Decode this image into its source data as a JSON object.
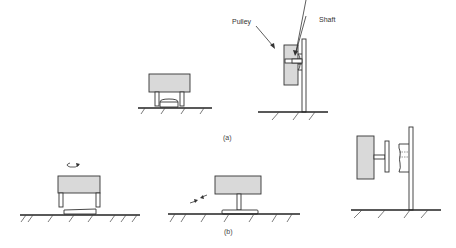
{
  "figure": {
    "panel_a": {
      "caption": "(a)",
      "labels": {
        "pulley": "Pulley",
        "shaft": "Shaft"
      },
      "left_view": "block on legs resting on pulley puck on ground",
      "right_view": "block with pulley mounted on shaft attached to vertical post"
    },
    "panel_b": {
      "caption": "(b)",
      "left_view": "block on legs over flat plate with rotation arrow",
      "middle_view": "block on single stem with base plate, motion arrows",
      "right_view": "block with shaft and flange, pulley on vertical post"
    }
  },
  "colors": {
    "block_fill": "#d9d9d9",
    "stroke": "#333333",
    "background": "#ffffff"
  }
}
